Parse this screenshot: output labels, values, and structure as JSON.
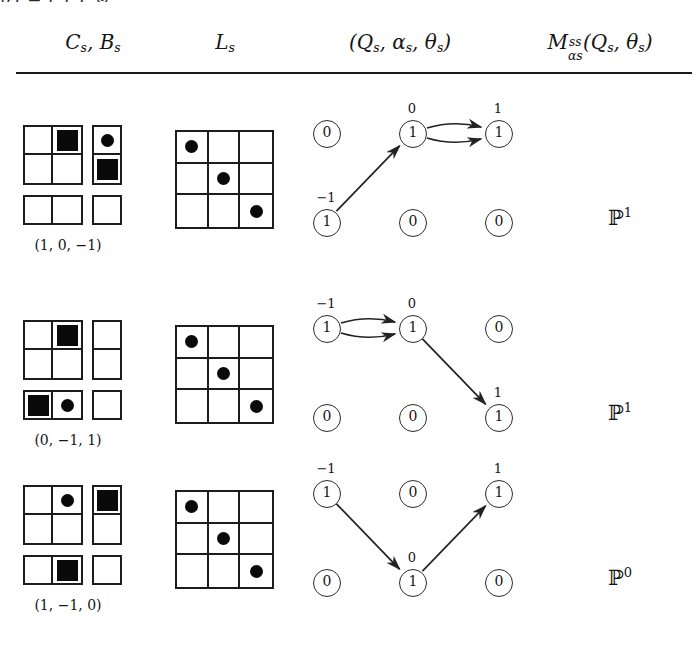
{
  "top_cut_text": "ϑ)  =  (  )     1        ⊚",
  "header": {
    "col1": {
      "base1": "C",
      "sub1": "s",
      "sep": ", ",
      "base2": "B",
      "sub2": "s"
    },
    "col2": {
      "base": "L",
      "sub": "s"
    },
    "col3": {
      "text": "(Q",
      "sub1": "s",
      "mid": ", α",
      "sub2": "s",
      "mid2": ", θ",
      "sub3": "s",
      "close": ")"
    },
    "col4": {
      "base": "M",
      "sup": "ss",
      "sub": "αs",
      "rest": "(Q",
      "sub_q": "s",
      "mid": ", θ",
      "sub_t": "s",
      "close": ")"
    }
  },
  "rows": [
    {
      "id": "row-1",
      "triple": "(1, 0, −1)",
      "cb": {
        "block_a": {
          "cols": 2,
          "rows": 2,
          "cells": [
            {
              "mark": "none"
            },
            {
              "mark": "square"
            },
            {
              "mark": "none"
            },
            {
              "mark": "none"
            }
          ]
        },
        "block_b": {
          "cols": 1,
          "rows": 2,
          "cells": [
            {
              "mark": "dot"
            },
            {
              "mark": "square"
            }
          ]
        },
        "block_c": {
          "cols": 2,
          "rows": 1,
          "cells": [
            {
              "mark": "none"
            },
            {
              "mark": "none"
            }
          ]
        },
        "block_d": {
          "cols": 1,
          "rows": 1,
          "cells": [
            {
              "mark": "none"
            }
          ]
        }
      },
      "lgrid": [
        {
          "mark": "dot"
        },
        {
          "mark": "none"
        },
        {
          "mark": "none"
        },
        {
          "mark": "none"
        },
        {
          "mark": "dot"
        },
        {
          "mark": "none"
        },
        {
          "mark": "none"
        },
        {
          "mark": "none"
        },
        {
          "mark": "dot"
        }
      ],
      "graph": {
        "nodes": [
          {
            "pos": "top-left",
            "value": "0",
            "label": ""
          },
          {
            "pos": "top-mid",
            "value": "1",
            "label": "0"
          },
          {
            "pos": "top-right",
            "value": "1",
            "label": "1"
          },
          {
            "pos": "bot-left",
            "value": "1",
            "label": "−1"
          },
          {
            "pos": "bot-mid",
            "value": "0",
            "label": ""
          },
          {
            "pos": "bot-right",
            "value": "0",
            "label": ""
          }
        ],
        "edges": [
          {
            "from": "bot-left",
            "to": "top-mid",
            "style": "straight"
          },
          {
            "from": "top-mid",
            "to": "top-right",
            "style": "curve-up"
          },
          {
            "from": "top-mid",
            "to": "top-right",
            "style": "curve-down"
          }
        ]
      },
      "value": {
        "symbol": "P",
        "exponent": "1"
      }
    },
    {
      "id": "row-2",
      "triple": "(0, −1, 1)",
      "cb": {
        "block_a": {
          "cols": 2,
          "rows": 2,
          "cells": [
            {
              "mark": "none"
            },
            {
              "mark": "square"
            },
            {
              "mark": "none"
            },
            {
              "mark": "none"
            }
          ]
        },
        "block_b": {
          "cols": 1,
          "rows": 2,
          "cells": [
            {
              "mark": "none"
            },
            {
              "mark": "none"
            }
          ]
        },
        "block_c": {
          "cols": 2,
          "rows": 1,
          "cells": [
            {
              "mark": "square"
            },
            {
              "mark": "dot"
            }
          ]
        },
        "block_d": {
          "cols": 1,
          "rows": 1,
          "cells": [
            {
              "mark": "none"
            }
          ]
        }
      },
      "lgrid": [
        {
          "mark": "dot"
        },
        {
          "mark": "none"
        },
        {
          "mark": "none"
        },
        {
          "mark": "none"
        },
        {
          "mark": "dot"
        },
        {
          "mark": "none"
        },
        {
          "mark": "none"
        },
        {
          "mark": "none"
        },
        {
          "mark": "dot"
        }
      ],
      "graph": {
        "nodes": [
          {
            "pos": "top-left",
            "value": "1",
            "label": "−1"
          },
          {
            "pos": "top-mid",
            "value": "1",
            "label": "0"
          },
          {
            "pos": "top-right",
            "value": "0",
            "label": ""
          },
          {
            "pos": "bot-left",
            "value": "0",
            "label": ""
          },
          {
            "pos": "bot-mid",
            "value": "0",
            "label": ""
          },
          {
            "pos": "bot-right",
            "value": "1",
            "label": "1"
          }
        ],
        "edges": [
          {
            "from": "top-left",
            "to": "top-mid",
            "style": "curve-up"
          },
          {
            "from": "top-left",
            "to": "top-mid",
            "style": "curve-down"
          },
          {
            "from": "top-mid",
            "to": "bot-right",
            "style": "straight"
          }
        ]
      },
      "value": {
        "symbol": "P",
        "exponent": "1"
      }
    },
    {
      "id": "row-3",
      "triple": "(1, −1, 0)",
      "cb": {
        "block_a": {
          "cols": 2,
          "rows": 2,
          "cells": [
            {
              "mark": "none"
            },
            {
              "mark": "dot"
            },
            {
              "mark": "none"
            },
            {
              "mark": "none"
            }
          ]
        },
        "block_b": {
          "cols": 1,
          "rows": 2,
          "cells": [
            {
              "mark": "square"
            },
            {
              "mark": "none"
            }
          ]
        },
        "block_c": {
          "cols": 2,
          "rows": 1,
          "cells": [
            {
              "mark": "none"
            },
            {
              "mark": "square"
            }
          ]
        },
        "block_d": {
          "cols": 1,
          "rows": 1,
          "cells": [
            {
              "mark": "none"
            }
          ]
        }
      },
      "lgrid": [
        {
          "mark": "dot"
        },
        {
          "mark": "none"
        },
        {
          "mark": "none"
        },
        {
          "mark": "none"
        },
        {
          "mark": "dot"
        },
        {
          "mark": "none"
        },
        {
          "mark": "none"
        },
        {
          "mark": "none"
        },
        {
          "mark": "dot"
        }
      ],
      "graph": {
        "nodes": [
          {
            "pos": "top-left",
            "value": "1",
            "label": "−1"
          },
          {
            "pos": "top-mid",
            "value": "0",
            "label": ""
          },
          {
            "pos": "top-right",
            "value": "1",
            "label": "1"
          },
          {
            "pos": "bot-left",
            "value": "0",
            "label": ""
          },
          {
            "pos": "bot-mid",
            "value": "1",
            "label": "0"
          },
          {
            "pos": "bot-right",
            "value": "0",
            "label": ""
          }
        ],
        "edges": [
          {
            "from": "top-left",
            "to": "bot-mid",
            "style": "straight"
          },
          {
            "from": "bot-mid",
            "to": "top-right",
            "style": "straight"
          }
        ]
      },
      "value": {
        "symbol": "P",
        "exponent": "0"
      }
    }
  ],
  "layout": {
    "row_tops": [
      110,
      305,
      470
    ],
    "graph_origin_x": 310,
    "node_positions": {
      "top-left": [
        16,
        23
      ],
      "top-mid": [
        102,
        23
      ],
      "top-right": [
        188,
        23
      ],
      "bot-left": [
        16,
        112
      ],
      "bot-mid": [
        102,
        112
      ],
      "bot-right": [
        188,
        112
      ]
    }
  },
  "colors": {
    "ink": "#151515",
    "rule": "#1a1a1a",
    "fill": "#0a0a0a",
    "paper": "#ffffff"
  }
}
